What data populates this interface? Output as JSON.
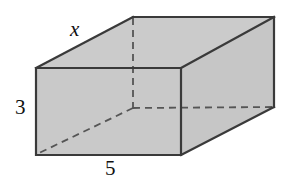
{
  "figure": {
    "name": "rectangular-prism",
    "background_color": "#ffffff"
  },
  "style": {
    "face_fill": "#c9c9c9",
    "face_fill_top": "#cbcbcb",
    "face_fill_right": "#c6c6c6",
    "edge_color": "#3a3a3a",
    "edge_width": 2.2,
    "hidden_edge_color": "#555555",
    "hidden_edge_width": 1.8,
    "hidden_edge_dash": "7 5",
    "label_color": "#111111"
  },
  "labels": {
    "depth": {
      "text": "x",
      "style": "italic",
      "edge": "top-left-receding-edge",
      "meaning": "unknown depth of the box"
    },
    "height": {
      "text": "3",
      "style": "upright",
      "edge": "front-left-vertical-edge",
      "meaning": "height of the box"
    },
    "width": {
      "text": "5",
      "style": "upright",
      "edge": "front-bottom-edge",
      "meaning": "width of the box"
    }
  },
  "geometry": {
    "front_face": [
      [
        36,
        68
      ],
      [
        181,
        68
      ],
      [
        181,
        155
      ],
      [
        36,
        155
      ]
    ],
    "top_face": [
      [
        36,
        68
      ],
      [
        133,
        17
      ],
      [
        274,
        17
      ],
      [
        181,
        68
      ]
    ],
    "right_face": [
      [
        181,
        68
      ],
      [
        274,
        17
      ],
      [
        274,
        107
      ],
      [
        181,
        155
      ]
    ],
    "hidden_vertex": [
      133,
      108
    ],
    "hidden_edges": [
      {
        "from": [
          133,
          17
        ],
        "to": [
          133,
          108
        ],
        "name": "back-left-vertical-hidden-edge"
      },
      {
        "from": [
          133,
          108
        ],
        "to": [
          274,
          107
        ],
        "name": "back-bottom-right-hidden-edge"
      },
      {
        "from": [
          133,
          108
        ],
        "to": [
          36,
          155
        ],
        "name": "back-bottom-left-hidden-edge"
      }
    ]
  }
}
